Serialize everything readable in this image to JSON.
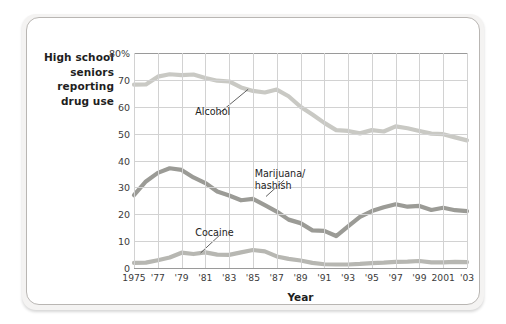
{
  "figure": {
    "y_axis_title": [
      "High school",
      "seniors",
      "reporting",
      "drug use"
    ],
    "x_axis_title": "Year"
  },
  "chart_data": {
    "type": "line",
    "title": "High school seniors reporting drug use",
    "xlabel": "Year",
    "ylabel": "High school seniors reporting drug use",
    "ylim": [
      0,
      80
    ],
    "xlim": [
      1975,
      2003
    ],
    "grid": true,
    "legend_position": "inline-annotations",
    "ytick_values": [
      0,
      10,
      20,
      30,
      40,
      50,
      60,
      70,
      80
    ],
    "ytick_labels": [
      "0",
      "10",
      "20",
      "30",
      "40",
      "50",
      "60",
      "70",
      "80%"
    ],
    "xtick_values": [
      1975,
      1977,
      1979,
      1981,
      1983,
      1985,
      1987,
      1989,
      1991,
      1993,
      1995,
      1997,
      1999,
      2001,
      2003
    ],
    "xtick_labels": [
      "1975",
      "'77",
      "'79",
      "'81",
      "'83",
      "'85",
      "'87",
      "'89",
      "'91",
      "'93",
      "'95",
      "'97",
      "'99",
      "2001",
      "'03"
    ],
    "x": [
      1975,
      1976,
      1977,
      1978,
      1979,
      1980,
      1981,
      1982,
      1983,
      1984,
      1985,
      1986,
      1987,
      1988,
      1989,
      1990,
      1991,
      1992,
      1993,
      1994,
      1995,
      1996,
      1997,
      1998,
      1999,
      2000,
      2001,
      2002,
      2003
    ],
    "series": [
      {
        "name": "Alcohol",
        "color": "#c9c9c4",
        "values": [
          68.2,
          68.3,
          71.2,
          72.1,
          71.8,
          72.0,
          70.7,
          69.7,
          69.4,
          67.2,
          65.9,
          65.3,
          66.4,
          63.9,
          60.0,
          57.1,
          54.0,
          51.3,
          51.0,
          50.1,
          51.3,
          50.8,
          52.7,
          52.0,
          51.0,
          50.0,
          49.8,
          48.6,
          47.5
        ]
      },
      {
        "name": "Marijuana/\nhashish",
        "label_lines": [
          "Marijuana/",
          "hashish"
        ],
        "color": "#9b9b96",
        "values": [
          27.1,
          32.2,
          35.4,
          37.1,
          36.5,
          33.7,
          31.6,
          28.5,
          27.0,
          25.2,
          25.7,
          23.4,
          21.0,
          18.0,
          16.7,
          14.0,
          13.8,
          11.9,
          15.5,
          19.0,
          21.2,
          22.6,
          23.7,
          22.8,
          23.1,
          21.6,
          22.4,
          21.5,
          21.2
        ]
      },
      {
        "name": "Cocaine",
        "color": "#b7b7b2",
        "values": [
          1.9,
          2.0,
          2.9,
          3.9,
          5.7,
          5.2,
          5.8,
          5.0,
          4.9,
          5.8,
          6.7,
          6.2,
          4.3,
          3.4,
          2.8,
          1.9,
          1.4,
          1.3,
          1.3,
          1.5,
          1.8,
          2.0,
          2.3,
          2.4,
          2.6,
          2.1,
          2.1,
          2.3,
          2.2
        ]
      }
    ],
    "annotations": [
      {
        "text": "Alcohol",
        "x": 1982,
        "y": 58
      },
      {
        "text": "Marijuana/ hashish",
        "x": 1987,
        "y": 35
      },
      {
        "text": "Cocaine",
        "x": 1982,
        "y": 13
      }
    ]
  }
}
